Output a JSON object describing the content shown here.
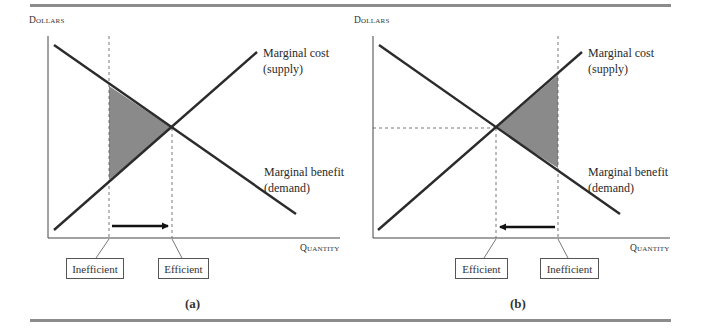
{
  "figure": {
    "panels": [
      {
        "id": "a",
        "caption": "(a)",
        "y_axis_label": "Dollars",
        "x_axis_label": "Quantity",
        "supply_label_1": "Marginal cost",
        "supply_label_2": "(supply)",
        "demand_label_1": "Marginal benefit",
        "demand_label_2": "(demand)",
        "left_box": "Inefficient",
        "right_box": "Efficient",
        "arrow_direction": "right"
      },
      {
        "id": "b",
        "caption": "(b)",
        "y_axis_label": "Dollars",
        "x_axis_label": "Quantity",
        "supply_label_1": "Marginal cost",
        "supply_label_2": "(supply)",
        "demand_label_1": "Marginal benefit",
        "demand_label_2": "(demand)",
        "left_box": "Efficient",
        "right_box": "Inefficient",
        "arrow_direction": "left"
      }
    ],
    "colors": {
      "rule": "#8c8c8c",
      "line": "#2b2b2b",
      "shade": "#8a8a8a"
    }
  }
}
